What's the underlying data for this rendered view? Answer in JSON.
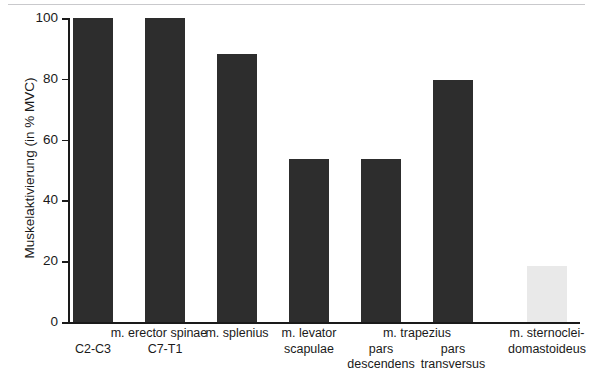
{
  "chart_data": {
    "type": "bar",
    "title": "",
    "subtitle": "",
    "xlabel": "",
    "ylabel": "Muskelaktivierung (in % MVC)",
    "ylim": [
      0,
      100
    ],
    "yticks": [
      "0",
      "20",
      "40",
      "60",
      "80",
      "100"
    ],
    "grid": false,
    "legend": "none",
    "categories": [
      "m. erector spinae C2-C3",
      "m. erector spinae C7-T1",
      "m. splenius",
      "m. levator scapulae",
      "m. trapezius pars descendens",
      "m. trapezius pars transversus",
      "m. sternocleidomastoideus"
    ],
    "values": [
      100,
      100,
      88,
      53.5,
      53.5,
      79.5,
      18.5
    ],
    "bar_colors": [
      "#2d2d2d",
      "#2d2d2d",
      "#2d2d2d",
      "#2d2d2d",
      "#2d2d2d",
      "#2d2d2d",
      "#e9e9e9"
    ]
  },
  "axis": {
    "y_title": "Muskelaktivierung (in % MVC)",
    "ticks": [
      {
        "value": 100,
        "label": "100"
      },
      {
        "value": 80,
        "label": "80"
      },
      {
        "value": 60,
        "label": "60"
      },
      {
        "value": 40,
        "label": "40"
      },
      {
        "value": 20,
        "label": "20"
      },
      {
        "value": 0,
        "label": "0"
      }
    ]
  },
  "bars": [
    {
      "value": 100,
      "color": "#2d2d2d"
    },
    {
      "value": 100,
      "color": "#2d2d2d"
    },
    {
      "value": 88,
      "color": "#2d2d2d"
    },
    {
      "value": 53.5,
      "color": "#2d2d2d"
    },
    {
      "value": 53.5,
      "color": "#2d2d2d"
    },
    {
      "value": 79.5,
      "color": "#2d2d2d"
    },
    {
      "value": 18.5,
      "color": "#e9e9e9"
    }
  ],
  "category_labels": {
    "group_erector": "m. erector spinae",
    "sub_c2c3": "C2-C3",
    "sub_c7t1": "C7-T1",
    "splenius_line1": "m. splenius",
    "levator_line1": "m. levator",
    "levator_line2": "scapulae",
    "group_trapezius": "m. trapezius",
    "trap_desc_line1": "pars",
    "trap_desc_line2": "descendens",
    "trap_trans_line1": "pars",
    "trap_trans_line2": "transversus",
    "scm_line1": "m. sternoclei-",
    "scm_line2": "domastoideus"
  }
}
